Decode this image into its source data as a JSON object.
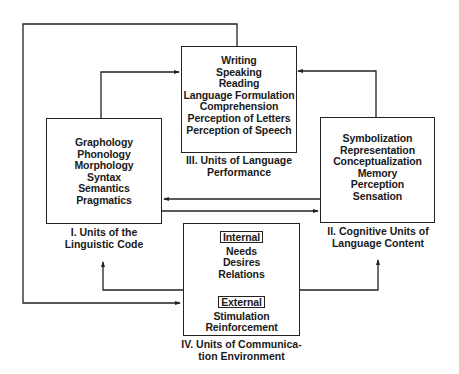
{
  "diagram": {
    "boxes": {
      "linguistic_code": {
        "items": [
          "Graphology",
          "Phonology",
          "Morphology",
          "Syntax",
          "Semantics",
          "Pragmatics"
        ],
        "caption_line1": "I. Units of the",
        "caption_line2": "Linguistic Code"
      },
      "language_content": {
        "items": [
          "Symbolization",
          "Representation",
          "Conceptualization",
          "Memory",
          "Perception",
          "Sensation"
        ],
        "caption_line1": "II. Cognitive Units of",
        "caption_line2": "Language Content"
      },
      "language_performance": {
        "items": [
          "Writing",
          "Speaking",
          "Reading",
          "Language Formulation",
          "Comprehension",
          "Perception of Letters",
          "Perception of Speech"
        ],
        "caption_line1": "III. Units of Language",
        "caption_line2": "Performance"
      },
      "communication_environment": {
        "internal_label": "Internal",
        "internal_items": [
          "Needs",
          "Desires",
          "Relations"
        ],
        "external_label": "External",
        "external_items": [
          "Stimulation",
          "Reinforcement"
        ],
        "caption_line1": "IV. Units of Communica-",
        "caption_line2": "tion Environment"
      }
    },
    "colors": {
      "line": "#222222",
      "background": "#ffffff"
    }
  }
}
